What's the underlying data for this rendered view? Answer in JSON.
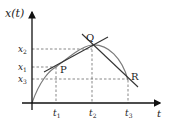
{
  "diagram": {
    "axes": {
      "y_label": "x(t)",
      "x_label": "t"
    },
    "x_ticks": [
      {
        "id": "t1",
        "label": "t",
        "sub": "1"
      },
      {
        "id": "t2",
        "label": "t",
        "sub": "2"
      },
      {
        "id": "t3",
        "label": "t",
        "sub": "3"
      }
    ],
    "y_ticks": [
      {
        "id": "x2",
        "label": "x",
        "sub": "2"
      },
      {
        "id": "x1",
        "label": "x",
        "sub": "1"
      },
      {
        "id": "x3",
        "label": "x",
        "sub": "3"
      }
    ],
    "points": [
      {
        "id": "P",
        "label": "P"
      },
      {
        "id": "Q",
        "label": "Q"
      },
      {
        "id": "R",
        "label": "R"
      }
    ],
    "colors": {
      "axis": "#111111",
      "curve": "#7a7a7a",
      "tangent": "#333333",
      "guide": "#555555"
    }
  }
}
